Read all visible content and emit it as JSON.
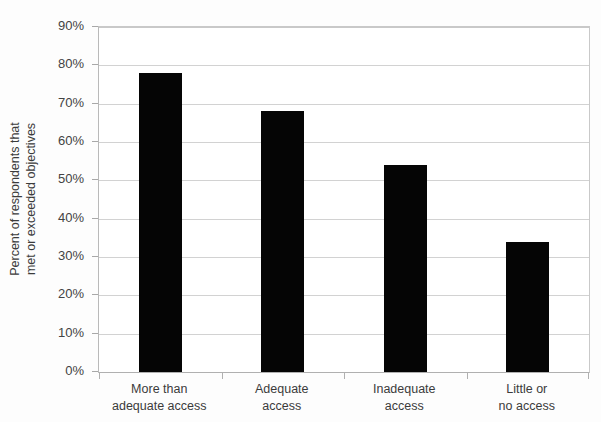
{
  "chart_data": {
    "type": "bar",
    "title": "",
    "xlabel": "",
    "ylabel": "Percent of respondents that met or exceeded objectives",
    "ylabel_lines": [
      "Percent of respondents that",
      "met or exceeded objectives"
    ],
    "categories": [
      "More than adequate access",
      "Adequate access",
      "Inadequate access",
      "Little or no access"
    ],
    "category_lines": [
      [
        "More than",
        "adequate access"
      ],
      [
        "Adequate",
        "access"
      ],
      [
        "Inadequate",
        "access"
      ],
      [
        "Little or",
        "no access"
      ]
    ],
    "values": [
      78,
      68,
      54,
      34
    ],
    "value_labels": [
      "78%",
      "68%",
      "54%",
      "34%"
    ],
    "ylim": [
      0,
      90
    ],
    "ytick_values": [
      0,
      10,
      20,
      30,
      40,
      50,
      60,
      70,
      80,
      90
    ],
    "ytick_labels": [
      "0%",
      "10%",
      "20%",
      "30%",
      "40%",
      "50%",
      "60%",
      "70%",
      "80%",
      "90%"
    ],
    "grid": true,
    "legend": null,
    "bar_color": "#050505",
    "gridline_color": "#d2d2d2",
    "axis_color": "#b0b0b0",
    "background_color": "#ffffff",
    "text_color": "#3b3b3b"
  }
}
